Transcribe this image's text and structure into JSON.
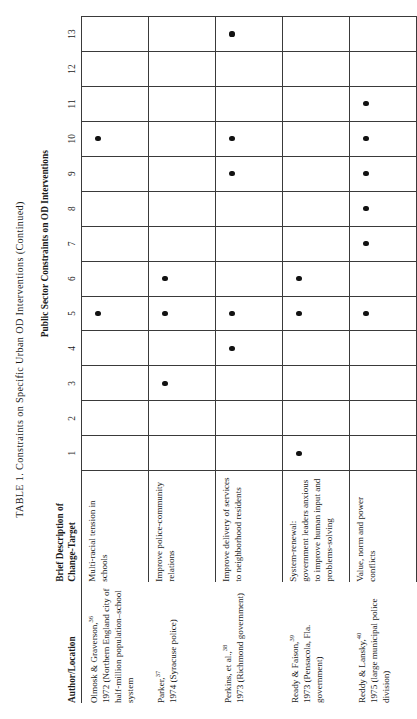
{
  "caption": "TABLE 1.  Constraints on Specific Urban OD Interventions (Continued)",
  "spanner": "Public Sector Constraints on OD Interventions",
  "headers": {
    "author": "Author/Location",
    "description_line1": "Brief Description of",
    "description_line2": "Change-Target"
  },
  "constraint_columns": [
    "1",
    "2",
    "3",
    "4",
    "5",
    "6",
    "7",
    "8",
    "9",
    "10",
    "11",
    "12",
    "13"
  ],
  "dot_glyph": "●",
  "colors": {
    "rule": "#3a3a3a",
    "text": "#1a1a1a",
    "dot": "#121212",
    "page": "#ffffff"
  },
  "rows": [
    {
      "author": "Olmosk & Graverson,",
      "author_note": "36",
      "author_rest": "1972 (Northern England city of half-million population–school system",
      "description": "Multi-racial tension in schools",
      "marks": [
        "5",
        "10"
      ]
    },
    {
      "author": "Parker,",
      "author_note": "37",
      "author_rest": "1974 (Syracuse police)",
      "description": "Improve police-community relations",
      "marks": [
        "3",
        "5",
        "6"
      ]
    },
    {
      "author": "Perkins, et al.,",
      "author_note": "38",
      "author_rest": "1973 (Richmond government)",
      "description": "Improve delivery of services to neighborhood residents",
      "marks": [
        "4",
        "5",
        "9",
        "10",
        "13"
      ]
    },
    {
      "author": "Ready & Faison,",
      "author_note": "39",
      "author_rest": "1973 (Pensacola, Fla. government)",
      "description": "System-renewal: government leaders anxious to improve human input and problems-solving",
      "marks": [
        "1",
        "5",
        "6"
      ]
    },
    {
      "author": "Reddy & Lansky,",
      "author_note": "40",
      "author_rest": "1975 (large municipal police division)",
      "description": "Value, norm and power conflicts",
      "marks": [
        "5",
        "7",
        "8",
        "9",
        "10",
        "11"
      ]
    }
  ]
}
